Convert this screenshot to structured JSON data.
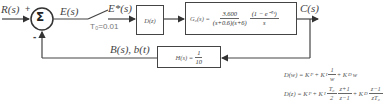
{
  "diagram": {
    "input_label": "R(s)",
    "input_sign": "+",
    "summing_junction_symbol": "Σ",
    "feedback_sign": "-",
    "error_label": "E(s)",
    "sampler": {
      "output_label": "E*(s)",
      "period_label": "T₀=0.01"
    },
    "controller": {
      "label": "D(z)"
    },
    "plant": {
      "lhs": "G₀(s) =",
      "numerator": "3.600",
      "denominator": "(s+0.6)(s+6)",
      "zoh_numerator": "(1 − e⁻ᵀˢ)",
      "zoh_denominator": "s"
    },
    "output_label": "C(s)",
    "feedback": {
      "signal_label": "B(s), b(t)",
      "block_lhs": "H(s) =",
      "block_numerator": "1",
      "block_denominator": "10"
    },
    "formulas": {
      "continuous": {
        "lhs": "D(w) = K",
        "kp_sub": "P",
        "plus1": " + K",
        "ki_sub": "I",
        "frac_num": "1",
        "frac_den": "w",
        "plus2": " + K",
        "kd_sub": "D",
        "tail": "w"
      },
      "discrete": {
        "lhs": "D(z) = K",
        "kp_sub": "P",
        "plus1": " + K",
        "ki_sub": "I",
        "t_num": "T₀",
        "t_den": "2",
        "z_num": "z+1",
        "z_den": "z−1",
        "plus2": " + K",
        "kd_sub": "D",
        "d_num": "z−1",
        "d_den": "zT₀"
      }
    }
  },
  "colors": {
    "line": "#444444",
    "text": "#444444",
    "background": "#ffffff"
  }
}
